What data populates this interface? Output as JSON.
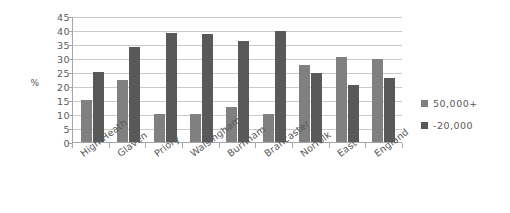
{
  "chart_data": {
    "type": "bar",
    "title": "",
    "xlabel": "",
    "ylabel": "%",
    "ylim": [
      0,
      45
    ],
    "yticks": [
      0,
      5,
      10,
      15,
      20,
      25,
      30,
      35,
      40,
      45
    ],
    "grid": true,
    "legend_position": "right",
    "categories": [
      "High Heath",
      "Glaven",
      "Priory",
      "Walsingham",
      "Burnham",
      "Brancaster",
      "Norfolk",
      "East",
      "England"
    ],
    "series": [
      {
        "name": "50,000+",
        "color": "#808080",
        "values": [
          15,
          22,
          10,
          10,
          12.5,
          10,
          27.5,
          30.5,
          29.5
        ]
      },
      {
        "name": "-20,000",
        "color": "#595959",
        "values": [
          25,
          34,
          39,
          38.5,
          36,
          39.5,
          24.5,
          20.5,
          23
        ]
      }
    ]
  },
  "axis": {
    "y_title": "%",
    "zero_label": "0",
    "tick_labels": [
      "45",
      "40",
      "35",
      "30",
      "25",
      "20",
      "15",
      "10",
      "5"
    ]
  },
  "legend": {
    "items": [
      {
        "label": "50,000+"
      },
      {
        "label": "-20,000"
      }
    ]
  }
}
